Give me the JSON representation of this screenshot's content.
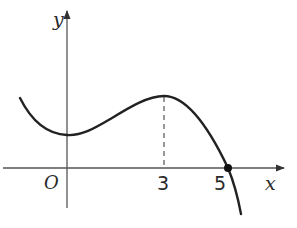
{
  "figure": {
    "type": "function-graph",
    "axes": {
      "x_label": "x",
      "y_label": "y",
      "origin_label": "O"
    },
    "tick_labels": [
      "3",
      "5"
    ],
    "features": {
      "local_minimum_x": 0,
      "local_maximum_x": 3,
      "x_intercept": 5,
      "dashed_line_at_x": 3,
      "marked_point": "(5, 0)"
    },
    "colors": {
      "curve": "#222222",
      "axes": "#444444",
      "background": "#ffffff"
    }
  }
}
